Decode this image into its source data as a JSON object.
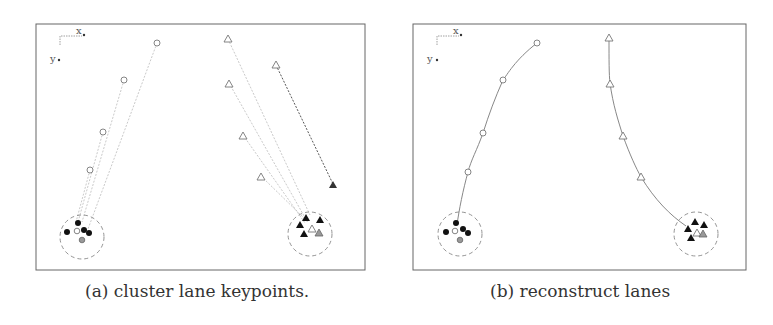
{
  "figure": {
    "panels": [
      {
        "id": "a",
        "caption": "(a) cluster lane keypoints.",
        "axis_labels": {
          "x": "x",
          "y": "y"
        },
        "description": "Lane keypoints projected with dashed offset lines toward cluster centers (dashed circles)"
      },
      {
        "id": "b",
        "caption": "(b) reconstruct lanes",
        "axis_labels": {
          "x": "x",
          "y": "y"
        },
        "description": "Keypoints connected into smooth reconstructed lane curves ending at cluster centers"
      }
    ],
    "legend_symbols": {
      "lane1_keypoint": "open circle",
      "lane2_keypoint": "open triangle",
      "cluster_member_lane1": "filled black circle",
      "cluster_member_lane2": "filled black triangle",
      "cluster_center": "dashed circle"
    }
  }
}
